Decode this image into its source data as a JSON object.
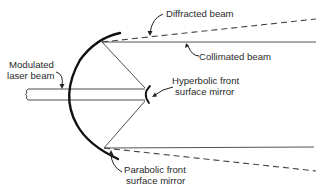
{
  "diagram": {
    "title": "",
    "labels": {
      "diffracted_beam": "Diffracted beam",
      "collimated_beam": "Collimated beam",
      "modulated_laser_beam_line1": "Modulated",
      "modulated_laser_beam_line2": "laser beam",
      "hyperbolic_mirror_line1": "Hyperbolic front",
      "hyperbolic_mirror_line2": "surface mirror",
      "parabolic_mirror_line1": "Parabolic front",
      "parabolic_mirror_line2": "surface mirror"
    },
    "components": [
      "modulated-laser-beam",
      "hyperbolic-front-surface-mirror",
      "parabolic-front-surface-mirror",
      "collimated-beam",
      "diffracted-beam"
    ],
    "colors": {
      "background": "#ffffff",
      "line": "#333333",
      "mirror": "#111111"
    }
  }
}
